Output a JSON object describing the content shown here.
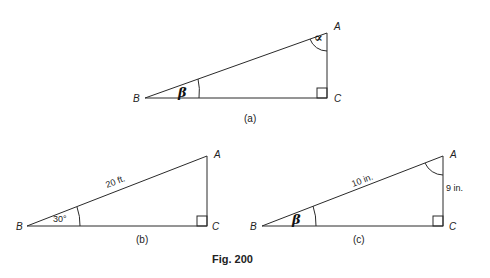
{
  "figure": {
    "caption": "Fig. 200",
    "line_color": "#2a2a2a"
  },
  "triangle_a": {
    "caption": "(a)",
    "vertices": {
      "A": "A",
      "B": "B",
      "C": "C"
    },
    "angle_at_A": "∝",
    "angle_at_B": "β",
    "right_angle_at": "C"
  },
  "triangle_b": {
    "caption": "(b)",
    "vertices": {
      "A": "A",
      "B": "B",
      "C": "C"
    },
    "hypotenuse_label": "20 ft.",
    "angle_at_B": "30°",
    "right_angle_at": "C"
  },
  "triangle_c": {
    "caption": "(c)",
    "vertices": {
      "A": "A",
      "B": "B",
      "C": "C"
    },
    "hypotenuse_label": "10 in.",
    "side_AC_label": "9 in.",
    "angle_at_B": "β",
    "right_angle_at": "C"
  }
}
